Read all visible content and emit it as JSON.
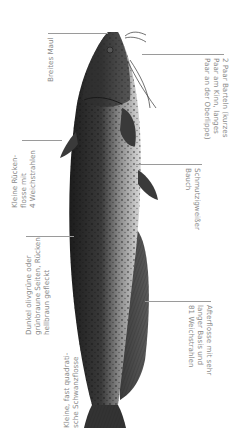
{
  "figure": {
    "orientation": "vertical, head up"
  },
  "labels": {
    "mouth": "Breites Maul",
    "barbels": "2 Paar Barteln (kurzes\nPaar am Kinn, langes\nPaar an der Oberlippe)",
    "dorsal_fin": "Kleine Rücken-\nflosse mit\n4 Weichstrahlen",
    "belly": "Schmutzigweißer\nBauch",
    "sides": "Dunkel olivgrüne oder\ngrünbraune Seiten, Rücken\nhellbraun gefleckt",
    "anal_fin": "Afterflosse mit sehr\nlanger Basis und\n81 Weichstrahlen",
    "tail_fin": "Kleine, fast quadrati-\nsche Schwanzflosse"
  },
  "colors": {
    "label_text": "#8a8a8a",
    "leader_line": "#9a9a9a",
    "back_dark": "#2a2a2a",
    "belly_light": "#dcdcdc"
  }
}
